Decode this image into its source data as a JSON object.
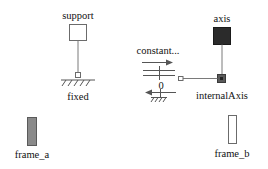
{
  "diagram": {
    "type": "modelica-icon-diagram",
    "components": {
      "support": {
        "label": "support",
        "fill": "#ffffff",
        "stroke": "#6b6b6b"
      },
      "fixed": {
        "label": "fixed"
      },
      "axis": {
        "label": "axis",
        "fill": "#2b2b2b",
        "stroke": "#1a1a1a"
      },
      "internalAxis": {
        "label": "internalAxis",
        "fill": "#5a5a5a"
      },
      "constant": {
        "label": "constant...",
        "value": "0"
      },
      "frame_a": {
        "label": "frame_a",
        "fill": "#8a8a8a",
        "stroke": "#5a5a5a"
      },
      "frame_b": {
        "label": "frame_b",
        "fill": "#ffffff",
        "stroke": "#6b6b6b"
      }
    },
    "colors": {
      "line": "#7a7a7a",
      "text": "#111111",
      "background": "#ffffff"
    }
  }
}
